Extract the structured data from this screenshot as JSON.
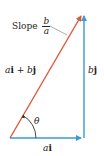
{
  "figure": {
    "type": "vector-diagram",
    "colors": {
      "resultant": "#e0573a",
      "components": "#3a9bd5",
      "text": "#222222",
      "leader": "#888888"
    },
    "labels": {
      "slope_word": "Slope",
      "slope_num": "b",
      "slope_den": "a",
      "resultant_a": "a",
      "resultant_i": "i",
      "resultant_plus": " + ",
      "resultant_b": "b",
      "resultant_j": "j",
      "vertical_b": "b",
      "vertical_j": "j",
      "horizontal_a": "a",
      "horizontal_i": "i",
      "angle": "θ"
    }
  }
}
